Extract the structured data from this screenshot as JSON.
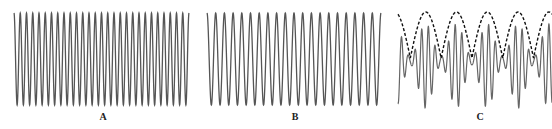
{
  "chart_data": [
    {
      "type": "line",
      "panel": "A",
      "title": "",
      "description": "Pure sinusoid, higher frequency",
      "x": {
        "start": 0,
        "end": 1
      },
      "series": [
        {
          "name": "wave A",
          "cycles": 28,
          "amplitude": 1.0,
          "style": "solid",
          "color": "#555555"
        }
      ],
      "ylim": [
        -1,
        1
      ],
      "grid": false,
      "label": "A"
    },
    {
      "type": "line",
      "panel": "B",
      "title": "",
      "description": "Pure sinusoid, lower frequency",
      "x": {
        "start": 0,
        "end": 1
      },
      "series": [
        {
          "name": "wave B",
          "cycles": 20,
          "amplitude": 1.0,
          "style": "solid",
          "color": "#555555"
        }
      ],
      "ylim": [
        -1,
        1
      ],
      "grid": false,
      "label": "B"
    },
    {
      "type": "line",
      "panel": "C",
      "title": "",
      "description": "Superposition of A and B showing beats, with dashed upper envelope",
      "x": {
        "start": 0,
        "end": 1
      },
      "series": [
        {
          "name": "sum A+B",
          "components_cycles": [
            28,
            20
          ],
          "style": "solid",
          "color": "#666666"
        },
        {
          "name": "envelope",
          "beat_periods": 5,
          "style": "dashed",
          "color": "#111111"
        }
      ],
      "ylim": [
        -2,
        2
      ],
      "grid": false,
      "label": "C"
    }
  ],
  "labels": {
    "a": "A",
    "b": "B",
    "c": "C"
  }
}
